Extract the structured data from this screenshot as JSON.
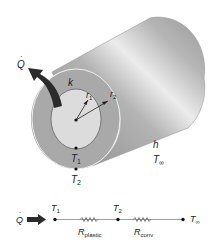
{
  "figure": {
    "cylinder_labels": {
      "heat_rate": "Q",
      "conductivity": "k",
      "inner_radius": {
        "base": "r",
        "sub": "1"
      },
      "outer_radius": {
        "base": "r",
        "sub": "2"
      },
      "convection_coeff": "h",
      "ambient_temp": {
        "base": "T",
        "sub": "∞"
      },
      "inner_temp": {
        "base": "T",
        "sub": "1"
      },
      "outer_temp": {
        "base": "T",
        "sub": "2"
      }
    },
    "network": {
      "heat_rate": "Q",
      "nodes": [
        {
          "base": "T",
          "sub": "1"
        },
        {
          "base": "T",
          "sub": "2"
        },
        {
          "base": "T",
          "sub": "∞"
        }
      ],
      "resistors": [
        {
          "base": "R",
          "sub": "plastic"
        },
        {
          "base": "R",
          "sub": "conv"
        }
      ]
    },
    "colors": {
      "cylinder_light": "#e8e8e8",
      "cylinder_mid": "#b9b9b9",
      "cylinder_dark": "#8c8c8c",
      "annulus": "#a9a9a9",
      "inner_face": "#dcdcdc",
      "arrow": "#2b2b2b",
      "line": "#555555"
    }
  }
}
